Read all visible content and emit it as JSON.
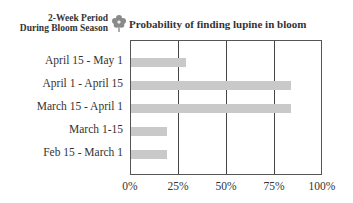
{
  "header": {
    "y_axis_title_line1": "2-Week Period",
    "y_axis_title_line2": "During Bloom Season",
    "icon": "lupine-flower-icon",
    "title": "Probability of finding lupine in bloom"
  },
  "chart_data": {
    "type": "bar",
    "orientation": "horizontal",
    "title": "Probability of finding lupine in bloom",
    "ylabel": "2-Week Period During Bloom Season",
    "xlabel": "",
    "categories": [
      "April 15 - May 1",
      "April 1 - April 15",
      "March 15 - April 1",
      "March 1-15",
      "Feb 15 - March 1"
    ],
    "values": [
      29,
      84,
      84,
      19,
      19
    ],
    "xlim": [
      0,
      100
    ],
    "x_ticks": [
      "0%",
      "25%",
      "50%",
      "75%",
      "100%"
    ],
    "grid": "vertical at 25%, 50%, 75%",
    "bar_color": "#c9c9c9",
    "legend": null
  }
}
